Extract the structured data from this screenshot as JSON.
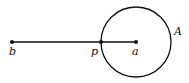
{
  "diagram": {
    "points": [
      {
        "id": "b",
        "label": "b",
        "x": 12,
        "y": 42,
        "label_x": 9,
        "label_y": 55
      },
      {
        "id": "p",
        "label": "p",
        "x": 101,
        "y": 42,
        "label_x": 91,
        "label_y": 55
      },
      {
        "id": "a",
        "label": "a",
        "x": 136,
        "y": 42,
        "label_x": 132,
        "label_y": 55
      }
    ],
    "segment": {
      "from": "b",
      "to": "a"
    },
    "circle": {
      "label": "A",
      "cx": 136,
      "cy": 42,
      "r": 35,
      "label_x": 174,
      "label_y": 35
    },
    "stroke_color": "#111111"
  }
}
